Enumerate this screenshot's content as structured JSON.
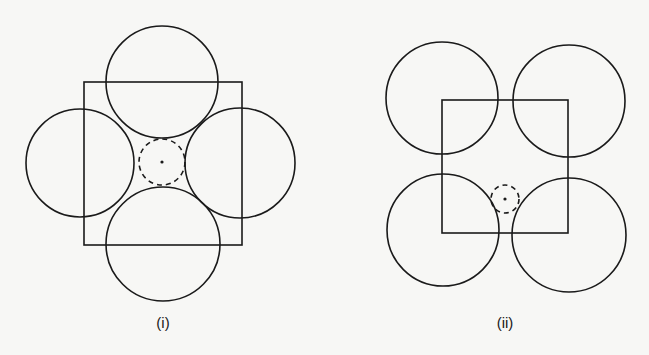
{
  "figures": [
    {
      "label": "(i)",
      "square": {
        "x": 84,
        "y": 82,
        "w": 158,
        "h": 163
      },
      "circles": [
        {
          "name": "top",
          "cx": 162,
          "cy": 82,
          "r": 56
        },
        {
          "name": "left",
          "cx": 80,
          "cy": 163,
          "r": 54
        },
        {
          "name": "right",
          "cx": 240,
          "cy": 163,
          "r": 55
        },
        {
          "name": "bottom",
          "cx": 163,
          "cy": 244,
          "r": 57
        }
      ],
      "interstitial": {
        "cx": 162,
        "cy": 162,
        "r": 23
      }
    },
    {
      "label": "(ii)",
      "square": {
        "x": 442,
        "y": 100,
        "w": 126,
        "h": 133
      },
      "circles": [
        {
          "name": "top-left",
          "cx": 442,
          "cy": 98,
          "r": 56
        },
        {
          "name": "top-right",
          "cx": 569,
          "cy": 101,
          "r": 56
        },
        {
          "name": "bottom-left",
          "cx": 443,
          "cy": 230,
          "r": 56
        },
        {
          "name": "bottom-right",
          "cx": 569,
          "cy": 235,
          "r": 57
        }
      ],
      "interstitial": {
        "cx": 505,
        "cy": 199,
        "r": 14
      }
    }
  ]
}
